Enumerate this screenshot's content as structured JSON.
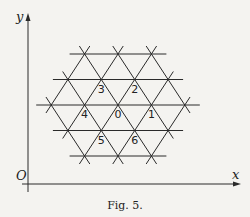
{
  "figure": {
    "caption": "Fig. 5.",
    "axes": {
      "x_label": "x",
      "y_label": "y",
      "origin_label": "O",
      "origin": [
        28,
        184
      ],
      "x_end": 241,
      "y_end": 13
    },
    "lattice": {
      "center": [
        118,
        105
      ],
      "spacing": 33.4,
      "row_height": 25.5,
      "radius": 2,
      "line_overhang": 8
    },
    "vertex_labels": [
      {
        "text": "0",
        "row": 0,
        "col": 0
      },
      {
        "text": "1",
        "row": 0,
        "col": 1
      },
      {
        "text": "2",
        "row": -1,
        "col": 0.5
      },
      {
        "text": "3",
        "row": -1,
        "col": -0.5
      },
      {
        "text": "4",
        "row": 0,
        "col": -1
      },
      {
        "text": "5",
        "row": 1,
        "col": -0.5
      },
      {
        "text": "6",
        "row": 1,
        "col": 0.5
      }
    ],
    "colors": {
      "ink": "#2a2a2a",
      "background": "#f4f3f0"
    }
  }
}
